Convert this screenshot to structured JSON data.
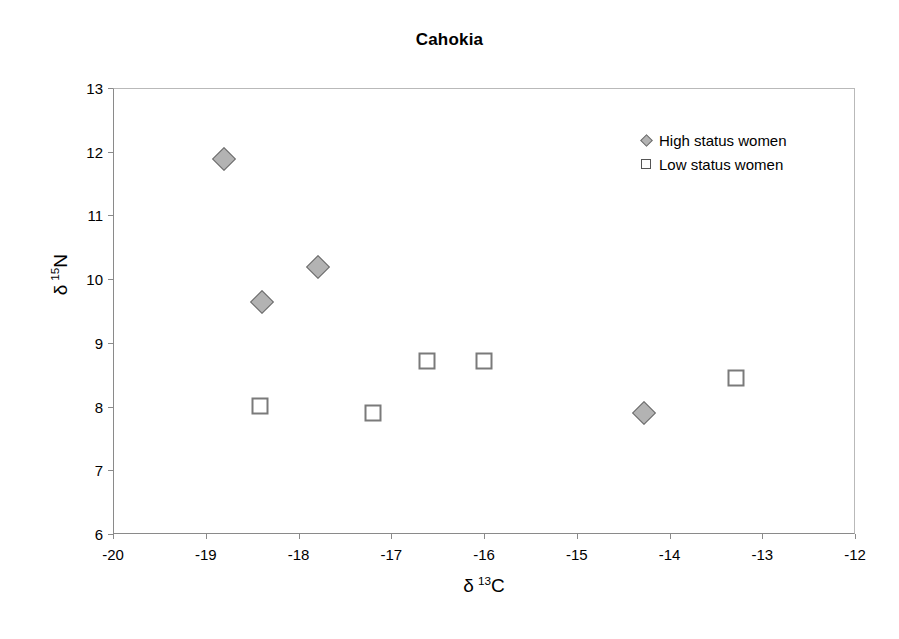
{
  "chart_data": {
    "type": "scatter",
    "title": "Cahokia",
    "xlabel": "δ 13C",
    "ylabel": "δ 15N",
    "xlabel_parts": {
      "symbol": "δ",
      "superscript": "13",
      "element": "C"
    },
    "ylabel_parts": {
      "symbol": "δ",
      "superscript": "15",
      "element": "N"
    },
    "xlim": [
      -20,
      -12
    ],
    "ylim": [
      6,
      13
    ],
    "xticks": [
      -20,
      -19,
      -18,
      -17,
      -16,
      -15,
      -14,
      -13,
      -12
    ],
    "yticks": [
      6,
      7,
      8,
      9,
      10,
      11,
      12,
      13
    ],
    "xtick_labels": [
      "-20",
      "-19",
      "-18",
      "-17",
      "-16",
      "-15",
      "-14",
      "-13",
      "-12"
    ],
    "ytick_labels": [
      "6",
      "7",
      "8",
      "9",
      "10",
      "11",
      "12",
      "13"
    ],
    "grid": false,
    "legend_position": "top-right-inside",
    "series": [
      {
        "name": "High status women",
        "marker": "diamond",
        "fill": "#b3b3b3",
        "stroke": "#6d6d6d",
        "points": [
          {
            "x": -18.81,
            "y": 11.9
          },
          {
            "x": -18.4,
            "y": 9.65
          },
          {
            "x": -17.8,
            "y": 10.2
          },
          {
            "x": -14.29,
            "y": 7.92
          }
        ]
      },
      {
        "name": "Low status women",
        "marker": "square",
        "fill": "#ffffff",
        "stroke": "#7a7a7a",
        "points": [
          {
            "x": -18.43,
            "y": 8.02
          },
          {
            "x": -17.21,
            "y": 7.92
          },
          {
            "x": -16.63,
            "y": 8.73
          },
          {
            "x": -16.01,
            "y": 8.73
          },
          {
            "x": -13.29,
            "y": 8.46
          }
        ]
      }
    ]
  },
  "legend": {
    "entries": [
      {
        "label": "High status women",
        "key": "diamond-marker-icon"
      },
      {
        "label": "Low status women",
        "key": "square-marker-icon"
      }
    ]
  }
}
